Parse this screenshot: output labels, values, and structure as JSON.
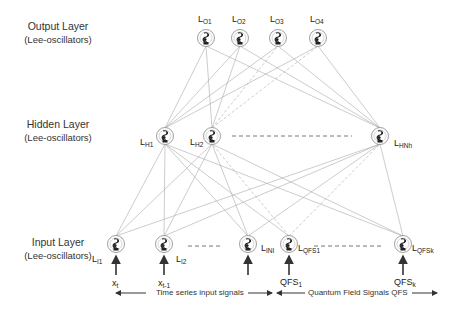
{
  "layers": {
    "output": {
      "title": "Output Layer",
      "subtitle": "(Lee-oscillators)"
    },
    "hidden": {
      "title": "Hidden Layer",
      "subtitle": "(Lee-oscillators)"
    },
    "input": {
      "title": "Input Layer",
      "subtitle": "(Lee-oscillators)"
    }
  },
  "nodes": {
    "output": [
      {
        "base": "L",
        "sub": "O1"
      },
      {
        "base": "L",
        "sub": "O2"
      },
      {
        "base": "L",
        "sub": "O3"
      },
      {
        "base": "L",
        "sub": "O4"
      }
    ],
    "hidden": [
      {
        "base": "L",
        "sub": "H1"
      },
      {
        "base": "L",
        "sub": "H2"
      },
      {
        "base": "L",
        "sub": "HNh"
      }
    ],
    "input": [
      {
        "base": "L",
        "sub": "I1"
      },
      {
        "base": "L",
        "sub": "I2"
      },
      {
        "base": "L",
        "sub": "INI"
      },
      {
        "base": "L",
        "sub": "QFS1"
      },
      {
        "base": "L",
        "sub": "QFSk"
      }
    ]
  },
  "signals": {
    "x_t": {
      "base": "x",
      "sub": "t"
    },
    "x_t1": {
      "base": "x",
      "sub": "t-1"
    },
    "qfs1": {
      "base": "QFS",
      "sub": "1"
    },
    "qfsk": {
      "base": "QFS",
      "sub": "k"
    }
  },
  "captions": {
    "time_series": "Time series input signals",
    "qfs": "Quantum Field Signals QFS"
  },
  "colors": {
    "edge": "#9a9a9a",
    "node_ring": "#888888",
    "text": "#222222"
  }
}
